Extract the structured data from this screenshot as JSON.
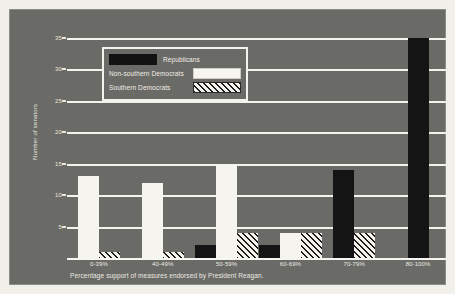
{
  "chart_data": {
    "type": "bar",
    "title": "",
    "subtitle": "",
    "xlabel": "Percentage support of measures endorsed by President Reagan.",
    "ylabel": "Number of senators",
    "categories": [
      "0-39%",
      "40-49%",
      "50-59%",
      "60-69%",
      "70-79%",
      "80-100%"
    ],
    "series": [
      {
        "name": "Republicans",
        "values": [
          0,
          0,
          2,
          2,
          14,
          35
        ],
        "color": "#141414",
        "pattern": "solid-black"
      },
      {
        "name": "Non-southern Democrats",
        "values": [
          13,
          12,
          15,
          4,
          0,
          0
        ],
        "color": "#f6f4ee",
        "pattern": "solid-white"
      },
      {
        "name": "Southern Democrats",
        "values": [
          1,
          1,
          4,
          4,
          4,
          0
        ],
        "color": "#e9e7e0",
        "pattern": "diagonal-hatch"
      }
    ],
    "ylim": [
      0,
      35
    ],
    "ytick_values": [
      5,
      10,
      15,
      20,
      25,
      30,
      35
    ],
    "ytick_labels": [
      "5",
      "10",
      "15",
      "20",
      "25",
      "30",
      "35"
    ],
    "grid": true,
    "grid_axis": "y",
    "legend_position": "upper-left-inside",
    "background_color": "#6a6a66",
    "grid_color": "#f4f2ec",
    "text_color": "#eceae3"
  },
  "legend": {
    "rows": [
      {
        "label": "Republicans",
        "swatch": "legend-swatch-republicans",
        "swatch_side": "left"
      },
      {
        "label": "Non-southern Democrats",
        "swatch": "legend-swatch-non-southern-democrats",
        "swatch_side": "right"
      },
      {
        "label": "Southern Democrats",
        "swatch": "legend-swatch-southern-democrats",
        "swatch_side": "right"
      }
    ]
  }
}
